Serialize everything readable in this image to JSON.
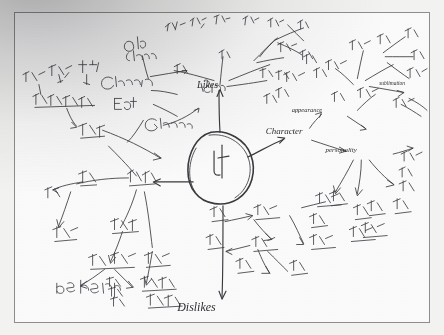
{
  "photo": {
    "subject": "hand-drawn mind map on white paper, photographed",
    "medium": "ballpoint pen on paper",
    "frame_color": "#8d8d8d",
    "paper_color": "#fefefe",
    "ink_color": "#3b3b40",
    "shadow_note": "soft dark shadow gradient across the upper-left corner"
  },
  "mindmap": {
    "center": {
      "label": "나",
      "shape": "oval",
      "cx": 211,
      "cy": 160,
      "rx": 30,
      "ry": 29
    },
    "branches": [
      {
        "id": "likes",
        "label": "Likes",
        "x": 205,
        "y": 78,
        "direction": "up",
        "script": "english"
      },
      {
        "id": "character",
        "label": "Character",
        "x": 278,
        "y": 124,
        "direction": "upper-right",
        "script": "english"
      },
      {
        "id": "dislikes",
        "label": "Dislikes",
        "x": 186,
        "y": 300,
        "direction": "down",
        "script": "english"
      },
      {
        "id": "hardships",
        "label": "힘든점",
        "x": 118,
        "y": 170,
        "direction": "left",
        "script": "korean"
      }
    ],
    "sub_nodes": [
      {
        "branch": "character",
        "label": "appearance",
        "x": 305,
        "y": 101,
        "script": "english"
      },
      {
        "branch": "character",
        "label": "personality",
        "x": 340,
        "y": 139,
        "script": "english"
      },
      {
        "branch": "character",
        "label": "sublimation",
        "x": 396,
        "y": 76,
        "script": "english"
      },
      {
        "branch": "likes",
        "label": "Old friend",
        "x": 122,
        "y": 35,
        "script": "english"
      },
      {
        "branch": "likes",
        "label": "Grandma",
        "x": 110,
        "y": 68,
        "script": "english"
      },
      {
        "branch": "likes",
        "label": "Eat",
        "x": 106,
        "y": 92,
        "script": "english"
      },
      {
        "branch": "likes",
        "label": "Games",
        "x": 150,
        "y": 113,
        "script": "english"
      },
      {
        "branch": "hardships",
        "label": "be healthy",
        "x": 72,
        "y": 276,
        "script": "english"
      }
    ],
    "clusters": [
      {
        "name": "upper-left-cluster",
        "x": 14,
        "y": 60,
        "w": 130,
        "h": 80,
        "note": "korean handwriting radiating to the left edge"
      },
      {
        "name": "upper-middle-cluster",
        "x": 150,
        "y": 8,
        "w": 120,
        "h": 60,
        "note": "korean handwriting above Likes"
      },
      {
        "name": "upper-right-cluster",
        "x": 260,
        "y": 10,
        "w": 120,
        "h": 90,
        "note": "korean handwriting, Likes branch"
      },
      {
        "name": "right-cluster",
        "x": 300,
        "y": 20,
        "w": 140,
        "h": 110,
        "note": "appearance sub-branches with sublimation"
      },
      {
        "name": "lower-right-cluster",
        "x": 290,
        "y": 150,
        "w": 120,
        "h": 90,
        "note": "personality sub-branches"
      },
      {
        "name": "lower-middle-cluster",
        "x": 210,
        "y": 205,
        "w": 110,
        "h": 80,
        "note": "Dislikes sub-branches"
      },
      {
        "name": "lower-left-cluster",
        "x": 30,
        "y": 185,
        "w": 150,
        "h": 110,
        "note": "hardships sub-branches"
      }
    ]
  }
}
